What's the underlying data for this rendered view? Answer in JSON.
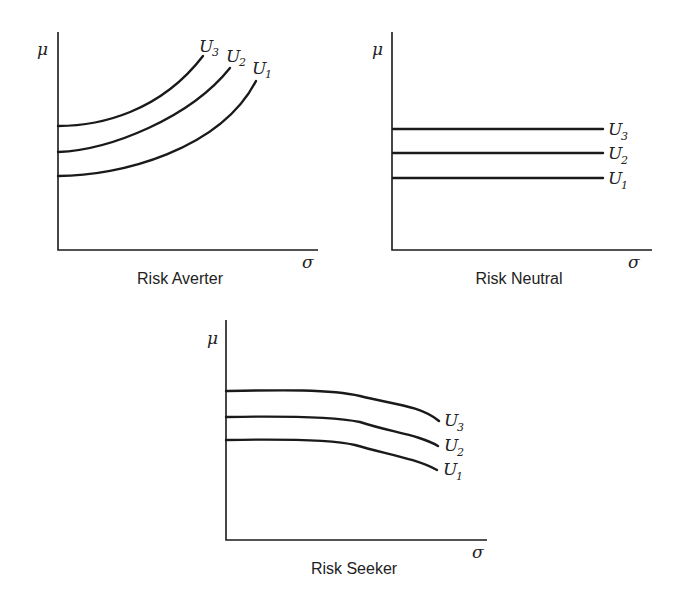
{
  "axes": {
    "y_label": "μ",
    "x_label": "σ"
  },
  "panels": [
    {
      "title": "Risk Averter",
      "curves": [
        "U",
        "U",
        "U"
      ],
      "subs": [
        "3",
        "2",
        "1"
      ]
    },
    {
      "title": "Risk Neutral",
      "curves": [
        "U",
        "U",
        "U"
      ],
      "subs": [
        "3",
        "2",
        "1"
      ]
    },
    {
      "title": "Risk Seeker",
      "curves": [
        "U",
        "U",
        "U"
      ],
      "subs": [
        "3",
        "2",
        "1"
      ]
    }
  ],
  "colors": {
    "line": "#1a1a1a",
    "background": "#ffffff"
  }
}
